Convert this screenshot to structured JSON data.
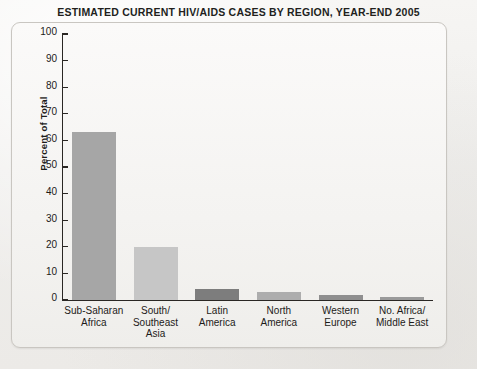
{
  "chart_data": {
    "type": "bar",
    "title": "ESTIMATED CURRENT HIV/AIDS CASES BY REGION, YEAR-END 2005",
    "xlabel": "",
    "ylabel": "Percent of Total",
    "ylim": [
      0,
      100
    ],
    "ytick_interval": 10,
    "yticks": [
      100,
      90,
      80,
      70,
      60,
      50,
      40,
      30,
      20,
      10,
      0
    ],
    "ytick_labels": [
      "100",
      "90",
      "80",
      "70",
      "60",
      "50",
      "40",
      "30",
      "20",
      "10",
      "0"
    ],
    "grid": false,
    "legend": false,
    "categories": [
      "Sub-Saharan\nAfrica",
      "South/\nSoutheast\nAsia",
      "Latin\nAmerica",
      "North\nAmerica",
      "Western\nEurope",
      "No. Africa/\nMiddle East"
    ],
    "values": [
      63,
      20,
      4,
      3,
      2,
      1
    ],
    "bar_colors": [
      "#a6a6a6",
      "#c6c6c6",
      "#7d7d7d",
      "#adadad",
      "#8f8f8f",
      "#9a9a9a"
    ]
  },
  "figure": {
    "background_color": "#f2f1ef",
    "panel_border_color": "#c9c6c1",
    "axis_color": "#2a2724",
    "text_color": "#1d1b19"
  }
}
